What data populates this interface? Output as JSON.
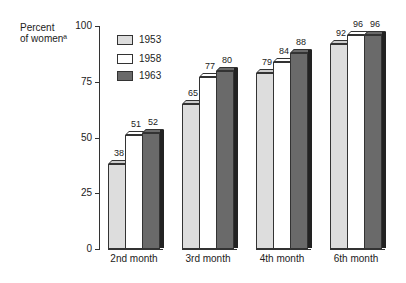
{
  "chart_data": {
    "type": "bar",
    "title": "",
    "xlabel": "",
    "ylabel": "Percent of womenª",
    "ylim": [
      0,
      100
    ],
    "yticks": [
      0,
      25,
      50,
      75,
      100
    ],
    "categories": [
      "2nd month",
      "3rd month",
      "4th month",
      "6th month"
    ],
    "series": [
      {
        "name": "1953",
        "values": [
          38,
          65,
          79,
          92
        ],
        "pattern": "dotted-light"
      },
      {
        "name": "1958",
        "values": [
          51,
          77,
          84,
          96
        ],
        "pattern": "white"
      },
      {
        "name": "1963",
        "values": [
          52,
          80,
          88,
          96
        ],
        "pattern": "dark-gray"
      }
    ],
    "legend_position": "upper-left",
    "grid": false
  },
  "axis": {
    "ylabel_line1": "Percent",
    "ylabel_line2": "of womenª",
    "ticks": [
      "100",
      "75",
      "50",
      "25",
      "0"
    ]
  },
  "legend": [
    "1953",
    "1958",
    "1963"
  ]
}
